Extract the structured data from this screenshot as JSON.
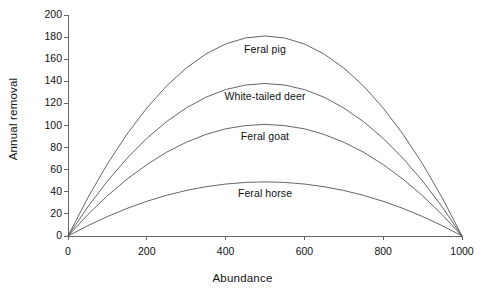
{
  "chart_data": {
    "type": "line",
    "title": "",
    "xlabel": "Abundance",
    "ylabel": "Annual removal",
    "xlim": [
      0,
      1000
    ],
    "ylim": [
      0,
      200
    ],
    "xticks": [
      0,
      200,
      400,
      600,
      800,
      1000
    ],
    "yticks": [
      0,
      20,
      40,
      60,
      80,
      100,
      120,
      140,
      160,
      180,
      200
    ],
    "grid": false,
    "legend_position": "inline-labels",
    "line_color": "#555555",
    "background_color": "#ffffff",
    "axis_color": "#666666",
    "text_color": "#111111",
    "x": [
      0,
      50,
      100,
      150,
      200,
      250,
      300,
      350,
      400,
      450,
      500,
      550,
      600,
      650,
      700,
      750,
      800,
      850,
      900,
      950,
      1000
    ],
    "series": [
      {
        "name": "Feral pig",
        "peak_x": 500,
        "peak_y": 181,
        "label_x": 500,
        "label_y": 168,
        "values": [
          0,
          34.4,
          65.2,
          92.3,
          115.8,
          135.8,
          152.0,
          164.7,
          173.8,
          179.2,
          181.0,
          179.2,
          173.8,
          164.7,
          152.0,
          135.8,
          115.8,
          92.3,
          65.2,
          34.4,
          0
        ]
      },
      {
        "name": "White-tailed deer",
        "peak_x": 500,
        "peak_y": 138,
        "label_x": 500,
        "label_y": 126,
        "values": [
          0,
          26.2,
          49.7,
          70.4,
          88.3,
          103.5,
          115.9,
          125.6,
          132.5,
          136.6,
          138.0,
          136.6,
          132.5,
          125.6,
          115.9,
          103.5,
          88.3,
          70.4,
          49.7,
          26.2,
          0
        ]
      },
      {
        "name": "Feral goat",
        "peak_x": 500,
        "peak_y": 101,
        "label_x": 500,
        "label_y": 90,
        "values": [
          0,
          19.2,
          36.4,
          51.5,
          64.6,
          75.8,
          84.8,
          91.9,
          97.0,
          99.9,
          101.0,
          99.9,
          97.0,
          91.9,
          84.8,
          75.8,
          64.6,
          51.5,
          36.4,
          19.2,
          0
        ]
      },
      {
        "name": "Feral horse",
        "peak_x": 500,
        "peak_y": 49,
        "label_x": 500,
        "label_y": 38,
        "values": [
          0,
          9.3,
          17.6,
          25.0,
          31.4,
          36.8,
          41.2,
          44.6,
          47.0,
          48.5,
          49.0,
          48.5,
          47.0,
          44.6,
          41.2,
          36.8,
          31.4,
          25.0,
          17.6,
          9.3,
          0
        ]
      }
    ]
  },
  "axes": {
    "ylabel": "Annual removal",
    "xlabel": "Abundance",
    "ytick_labels": [
      "200",
      "180",
      "160",
      "140",
      "120",
      "100",
      "80",
      "60",
      "40",
      "20",
      "0"
    ],
    "xtick_labels": [
      "0",
      "200",
      "400",
      "600",
      "800",
      "1000"
    ]
  },
  "series_labels": {
    "feral_pig": "Feral pig",
    "white_tailed_deer": "White-tailed deer",
    "feral_goat": "Feral goat",
    "feral_horse": "Feral horse"
  }
}
